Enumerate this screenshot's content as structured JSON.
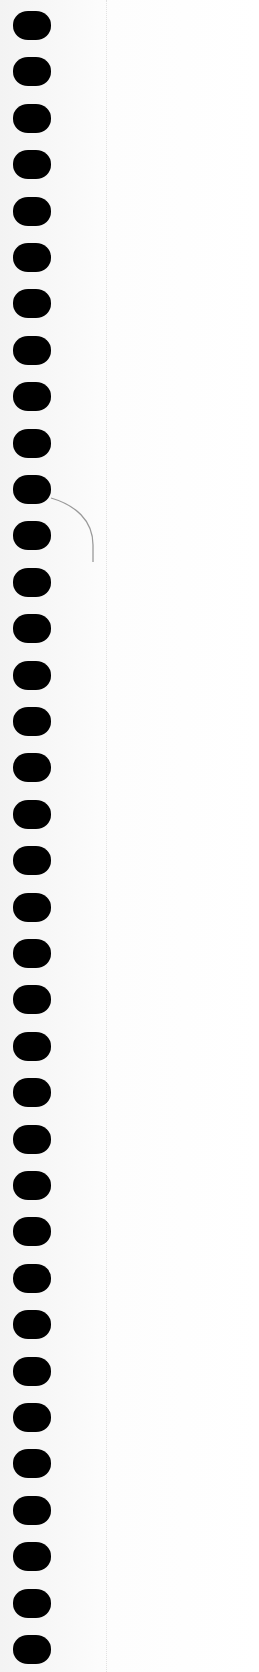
{
  "page": {
    "hole_count": 36,
    "hole_color": "#000000",
    "paper_color": "#fbfbfb",
    "arc_color": "#9a9a9a",
    "margin_line_color": "#e2e2e2"
  }
}
